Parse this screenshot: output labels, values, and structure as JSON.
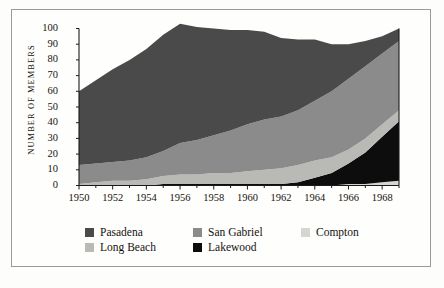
{
  "chart_data": {
    "type": "area",
    "stacked": true,
    "title": "",
    "subtitle": "",
    "xlabel": "",
    "ylabel": "NUMBER OF MEMBERS",
    "ylim": [
      0,
      100
    ],
    "xlim": [
      1950,
      1969
    ],
    "grid": false,
    "legend_position": "bottom",
    "y_ticks": [
      "100",
      "90",
      "80",
      "70",
      "60",
      "50",
      "40",
      "30",
      "20",
      "10",
      "0"
    ],
    "x_ticks": [
      "1950",
      "1952",
      "1954",
      "1956",
      "1958",
      "1960",
      "1962",
      "1964",
      "1966",
      "1968"
    ],
    "x": [
      1950,
      1951,
      1952,
      1953,
      1954,
      1955,
      1956,
      1957,
      1958,
      1959,
      1960,
      1961,
      1962,
      1963,
      1964,
      1965,
      1966,
      1967,
      1968,
      1969
    ],
    "stack_order_bottom_to_top": [
      "Compton",
      "Lakewood",
      "Long Beach",
      "San Gabriel",
      "Pasadena"
    ],
    "series": [
      {
        "name": "Pasadena",
        "color": "#4a4a4a",
        "values": [
          47,
          53,
          59,
          64,
          69,
          74,
          76,
          72,
          68,
          64,
          60,
          56,
          50,
          45,
          39,
          30,
          22,
          16,
          11,
          8
        ]
      },
      {
        "name": "San Gabriel",
        "color": "#8b8b8b",
        "values": [
          12,
          12,
          12,
          13,
          14,
          16,
          20,
          22,
          24,
          27,
          30,
          32,
          33,
          35,
          38,
          42,
          45,
          46,
          45,
          44
        ]
      },
      {
        "name": "Compton",
        "color": "#d5d5d2",
        "values": [
          0,
          0,
          0,
          0,
          0,
          0,
          0,
          0,
          0,
          0,
          0,
          0,
          0,
          0,
          0,
          0,
          1,
          1,
          2,
          3
        ]
      },
      {
        "name": "Long Beach",
        "color": "#b9b9b5",
        "values": [
          1,
          2,
          3,
          3,
          4,
          5,
          6,
          6,
          7,
          7,
          8,
          9,
          10,
          11,
          11,
          10,
          9,
          9,
          8,
          7
        ]
      },
      {
        "name": "Lakewood",
        "color": "#0d0d0d",
        "values": [
          0,
          0,
          0,
          0,
          0,
          1,
          1,
          1,
          1,
          1,
          1,
          1,
          1,
          2,
          5,
          8,
          13,
          20,
          29,
          38
        ]
      }
    ],
    "legend": [
      {
        "label": "Pasadena",
        "color": "#4a4a4a"
      },
      {
        "label": "San Gabriel",
        "color": "#8b8b8b"
      },
      {
        "label": "Compton",
        "color": "#d5d5d2"
      },
      {
        "label": "Long Beach",
        "color": "#b9b9b5"
      },
      {
        "label": "Lakewood",
        "color": "#0d0d0d"
      }
    ]
  },
  "axis": {
    "y_title": "NUMBER OF MEMBERS"
  }
}
